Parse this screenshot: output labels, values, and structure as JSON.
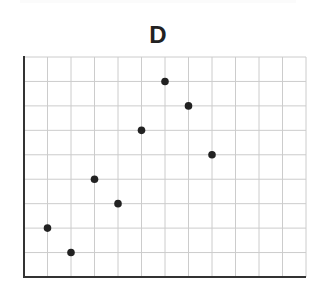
{
  "chart_data": {
    "type": "scatter",
    "title": "D",
    "xlabel": "",
    "ylabel": "",
    "x": [
      1,
      2,
      3,
      4,
      5,
      6,
      7,
      8
    ],
    "y": [
      2,
      1,
      4,
      3,
      6,
      8,
      7,
      5
    ],
    "xlim": [
      0,
      12
    ],
    "ylim": [
      0,
      9
    ],
    "grid": true,
    "legend": null,
    "tick_labels": "none",
    "marker_color": "#222222",
    "grid_color": "#cccccc",
    "axis_color": "#333333"
  }
}
